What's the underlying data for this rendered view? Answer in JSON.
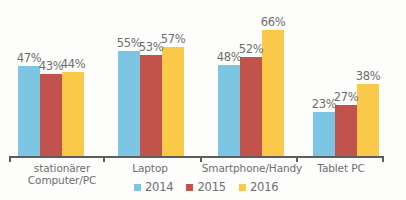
{
  "chart_data": {
    "type": "bar",
    "title": "",
    "subtitle": "",
    "xlabel": "",
    "ylabel": "",
    "ylim": [
      0,
      70
    ],
    "grid": false,
    "legend_position": "bottom",
    "value_suffix": "%",
    "categories": [
      "stationärer\nComputer/PC",
      "Laptop",
      "Smartphone/Handy",
      "Tablet PC"
    ],
    "series": [
      {
        "name": "2014",
        "color": "#7cc6e3",
        "values": [
          47,
          55,
          48,
          23
        ]
      },
      {
        "name": "2015",
        "color": "#c2534c",
        "values": [
          43,
          53,
          52,
          27
        ]
      },
      {
        "name": "2016",
        "color": "#fbc94a",
        "values": [
          44,
          57,
          66,
          38
        ]
      }
    ],
    "data_labels": [
      [
        "47%",
        "43%",
        "44%"
      ],
      [
        "55%",
        "53%",
        "57%"
      ],
      [
        "48%",
        "52%",
        "66%"
      ],
      [
        "23%",
        "27%",
        "38%"
      ]
    ]
  },
  "legend": {
    "items": [
      {
        "label": "2014",
        "color": "#7cc6e3"
      },
      {
        "label": "2015",
        "color": "#c2534c"
      },
      {
        "label": "2016",
        "color": "#fbc94a"
      }
    ]
  },
  "axis": {
    "tick_count": 5
  },
  "colors": {
    "axis": "#5d5d5d",
    "text": "#6e6e6e",
    "background": "#fdfdfc"
  }
}
